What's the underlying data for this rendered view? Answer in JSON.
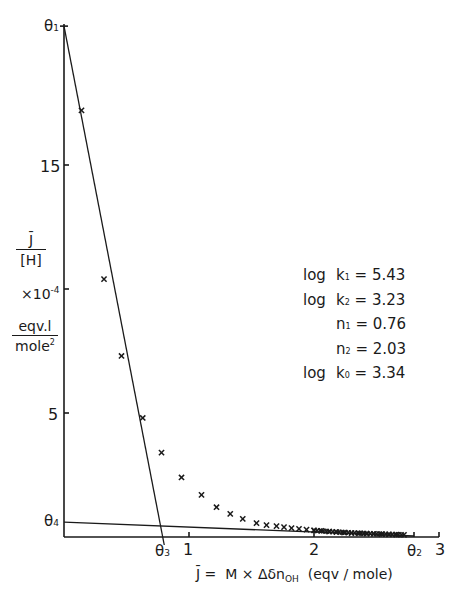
{
  "chart_data": {
    "type": "scatter",
    "title": "",
    "xlabel": "J̄ = M × Δδn_OH (eqv / mole)",
    "ylabel": "J̄ / [H] ×10^-4 eqv.l / mole²",
    "xlim": [
      0,
      3
    ],
    "ylim": [
      0,
      20.6
    ],
    "grid": false,
    "x_ticks": [
      "1",
      "2",
      "3"
    ],
    "y_ticks": [
      "5",
      "15"
    ],
    "y_tick_values": [
      5,
      10,
      15
    ],
    "series": [
      {
        "name": "measured",
        "marker": "x",
        "points": [
          [
            0.14,
            17.2
          ],
          [
            0.32,
            10.4
          ],
          [
            0.46,
            7.3
          ],
          [
            0.63,
            4.8
          ],
          [
            0.78,
            3.4
          ],
          [
            0.94,
            2.4
          ],
          [
            1.1,
            1.7
          ],
          [
            1.22,
            1.2
          ],
          [
            1.33,
            0.93
          ],
          [
            1.43,
            0.73
          ],
          [
            1.54,
            0.56
          ],
          [
            1.62,
            0.48
          ],
          [
            1.7,
            0.44
          ],
          [
            1.76,
            0.4
          ],
          [
            1.82,
            0.36
          ],
          [
            1.88,
            0.33
          ],
          [
            1.94,
            0.3
          ],
          [
            2.0,
            0.27
          ],
          [
            2.06,
            0.25
          ],
          [
            2.12,
            0.22
          ],
          [
            2.18,
            0.2
          ],
          [
            2.24,
            0.18
          ],
          [
            2.3,
            0.16
          ],
          [
            2.36,
            0.15
          ],
          [
            2.42,
            0.14
          ],
          [
            2.48,
            0.13
          ],
          [
            2.54,
            0.12
          ],
          [
            2.6,
            0.11
          ],
          [
            2.66,
            0.1
          ],
          [
            2.72,
            0.09
          ]
        ]
      }
    ],
    "lines": [
      {
        "name": "limiting line 1",
        "from": [
          0,
          20.6
        ],
        "to": [
          0.79,
          0
        ]
      },
      {
        "name": "limiting line 2",
        "from": [
          0,
          0.6
        ],
        "to": [
          2.8,
          0
        ]
      }
    ],
    "annotations": [
      "θ1",
      "θ2",
      "θ3",
      "θ4"
    ],
    "parameters": [
      {
        "label": "log k1",
        "value": "5.43"
      },
      {
        "label": "log k2",
        "value": "3.23"
      },
      {
        "label": "n1",
        "value": "0.76"
      },
      {
        "label": "n2",
        "value": "2.03"
      },
      {
        "label": "log k0",
        "value": "3.34"
      }
    ]
  },
  "labels": {
    "theta1": "θ",
    "theta1_sub": "1",
    "theta2": "θ",
    "theta2_sub": "2",
    "theta3": "θ",
    "theta3_sub": "3",
    "theta4": "θ",
    "theta4_sub": "4",
    "y15": "15",
    "y5": "5",
    "x1": "1",
    "x2": "2",
    "x3": "3",
    "ylabel_num": "J̄",
    "ylabel_den": "[H]",
    "ylabel_scale": "×10",
    "ylabel_exp": "-4",
    "yunit_num": "eqv.l",
    "yunit_den": "mole",
    "yunit_exp": "2",
    "xlabel_lhs": "J̄ =",
    "xlabel_mid": "M  ×  Δδn",
    "xlabel_sub": "OH",
    "xlabel_unit": "(eqv / mole)"
  },
  "params": [
    {
      "prefix": "log",
      "sym": "k",
      "sub": "1",
      "eq": "= 5.43"
    },
    {
      "prefix": "log",
      "sym": "k",
      "sub": "2",
      "eq": "= 3.23"
    },
    {
      "prefix": "",
      "sym": "n",
      "sub": "1",
      "eq": "= 0.76"
    },
    {
      "prefix": "",
      "sym": "n",
      "sub": "2",
      "eq": "= 2.03"
    },
    {
      "prefix": "log",
      "sym": "k",
      "sub": "0",
      "eq": "= 3.34"
    }
  ]
}
